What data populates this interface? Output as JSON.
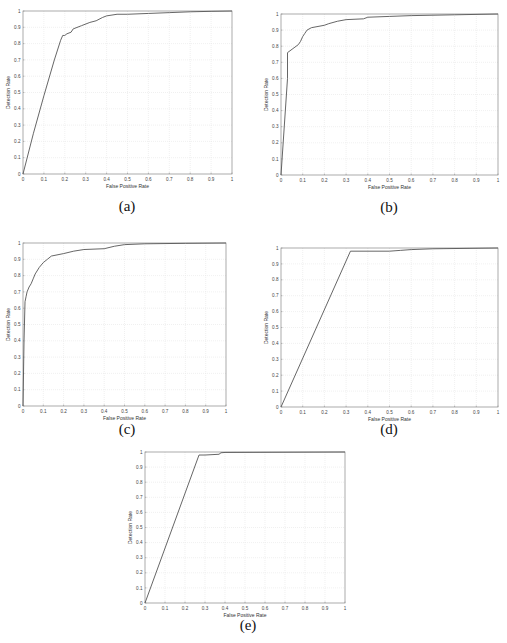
{
  "figure": {
    "captions": [
      "(a)",
      "(b)",
      "(c)",
      "(d)",
      "(e)"
    ]
  },
  "chart_data": [
    {
      "id": "a",
      "type": "line",
      "title": "",
      "caption": "(a)",
      "xlabel": "False Positive Rate",
      "ylabel": "Detection Rate",
      "xlim": [
        0,
        1
      ],
      "ylim": [
        0,
        1
      ],
      "xticks": [
        "0",
        "0.1",
        "0.2",
        "0.3",
        "0.4",
        "0.5",
        "0.6",
        "0.7",
        "0.8",
        "0.9",
        "1"
      ],
      "yticks": [
        "0",
        "0.1",
        "0.2",
        "0.3",
        "0.4",
        "0.5",
        "0.6",
        "0.7",
        "0.8",
        "0.9",
        "1"
      ],
      "grid": true,
      "legend": null,
      "values_note": "Approximate, traced from a low-resolution image. Axis ticks/labels and curve shape are reliable; intermediate point values are estimates.",
      "series": [
        {
          "name": "ROC",
          "x": [
            0,
            0.05,
            0.1,
            0.15,
            0.18,
            0.19,
            0.2,
            0.21,
            0.23,
            0.24,
            0.28,
            0.32,
            0.35,
            0.38,
            0.4,
            0.45,
            0.5,
            0.6,
            0.7,
            0.8,
            0.9,
            1.0
          ],
          "y": [
            0,
            0.25,
            0.48,
            0.7,
            0.82,
            0.85,
            0.85,
            0.86,
            0.87,
            0.89,
            0.91,
            0.93,
            0.94,
            0.96,
            0.97,
            0.98,
            0.98,
            0.985,
            0.99,
            0.995,
            0.998,
            1.0
          ]
        }
      ]
    },
    {
      "id": "b",
      "type": "line",
      "title": "",
      "caption": "(b)",
      "xlabel": "False Positive Rate",
      "ylabel": "Detection Rate",
      "xlim": [
        0,
        1
      ],
      "ylim": [
        0,
        1
      ],
      "xticks": [
        "0",
        "0.1",
        "0.2",
        "0.3",
        "0.4",
        "0.5",
        "0.6",
        "0.7",
        "0.8",
        "0.9",
        "1"
      ],
      "yticks": [
        "0",
        "0.1",
        "0.2",
        "0.3",
        "0.4",
        "0.5",
        "0.6",
        "0.7",
        "0.8",
        "0.9",
        "1"
      ],
      "grid": true,
      "legend": null,
      "values_note": "Approximate, traced from a low-resolution image. Axis ticks/labels and curve shape are reliable; intermediate point values are estimates.",
      "series": [
        {
          "name": "ROC",
          "x": [
            0,
            0.03,
            0.03,
            0.06,
            0.08,
            0.09,
            0.1,
            0.11,
            0.12,
            0.14,
            0.2,
            0.22,
            0.26,
            0.3,
            0.38,
            0.4,
            0.5,
            0.6,
            0.8,
            1.0
          ],
          "y": [
            0,
            0.6,
            0.76,
            0.79,
            0.81,
            0.83,
            0.86,
            0.88,
            0.9,
            0.915,
            0.93,
            0.94,
            0.955,
            0.965,
            0.97,
            0.98,
            0.985,
            0.99,
            0.995,
            1.0
          ]
        }
      ]
    },
    {
      "id": "c",
      "type": "line",
      "title": "",
      "caption": "(c)",
      "xlabel": "False Positive Rate",
      "ylabel": "Detection Rate",
      "xlim": [
        0,
        1
      ],
      "ylim": [
        0,
        1
      ],
      "xticks": [
        "0",
        "0.1",
        "0.2",
        "0.3",
        "0.4",
        "0.5",
        "0.6",
        "0.7",
        "0.8",
        "0.9",
        "1"
      ],
      "yticks": [
        "0",
        "0.1",
        "0.2",
        "0.3",
        "0.4",
        "0.5",
        "0.6",
        "0.7",
        "0.8",
        "0.9",
        "1"
      ],
      "grid": true,
      "legend": null,
      "values_note": "Approximate, traced from a low-resolution image. Axis ticks/labels and curve shape are reliable; intermediate point values are estimates.",
      "series": [
        {
          "name": "ROC",
          "x": [
            0,
            0.005,
            0.01,
            0.015,
            0.02,
            0.03,
            0.04,
            0.05,
            0.06,
            0.08,
            0.1,
            0.12,
            0.14,
            0.2,
            0.25,
            0.3,
            0.4,
            0.45,
            0.5,
            0.6,
            0.8,
            1.0
          ],
          "y": [
            0,
            0.4,
            0.64,
            0.67,
            0.7,
            0.73,
            0.75,
            0.78,
            0.81,
            0.85,
            0.88,
            0.9,
            0.92,
            0.935,
            0.95,
            0.96,
            0.965,
            0.98,
            0.99,
            0.995,
            0.998,
            1.0
          ]
        }
      ]
    },
    {
      "id": "d",
      "type": "line",
      "title": "",
      "caption": "(d)",
      "xlabel": "False Positive Rate",
      "ylabel": "Detection Rate",
      "xlim": [
        0,
        1
      ],
      "ylim": [
        0,
        1
      ],
      "xticks": [
        "0",
        "0.1",
        "0.2",
        "0.3",
        "0.4",
        "0.5",
        "0.6",
        "0.7",
        "0.8",
        "0.9",
        "1"
      ],
      "yticks": [
        "0",
        "0.1",
        "0.2",
        "0.3",
        "0.4",
        "0.5",
        "0.6",
        "0.7",
        "0.8",
        "0.9",
        "1"
      ],
      "grid": true,
      "legend": null,
      "values_note": "Approximate, traced from a low-resolution image. Axis ticks/labels and curve shape are reliable; intermediate point values are estimates.",
      "series": [
        {
          "name": "ROC",
          "x": [
            0,
            0.32,
            0.5,
            0.55,
            0.6,
            0.7,
            1.0
          ],
          "y": [
            0,
            0.98,
            0.98,
            0.985,
            0.99,
            0.995,
            1.0
          ]
        }
      ]
    },
    {
      "id": "e",
      "type": "line",
      "title": "",
      "caption": "(e)",
      "xlabel": "False Positive Rate",
      "ylabel": "Detection Rate",
      "xlim": [
        0,
        1
      ],
      "ylim": [
        0,
        1
      ],
      "xticks": [
        "0",
        "0.1",
        "0.2",
        "0.3",
        "0.4",
        "0.5",
        "0.6",
        "0.7",
        "0.8",
        "0.9",
        "1"
      ],
      "yticks": [
        "0",
        "0.1",
        "0.2",
        "0.3",
        "0.4",
        "0.5",
        "0.6",
        "0.7",
        "0.8",
        "0.9",
        "1"
      ],
      "grid": true,
      "legend": null,
      "values_note": "Approximate, traced from a low-resolution image. Axis ticks/labels and curve shape are reliable; intermediate point values are estimates.",
      "series": [
        {
          "name": "ROC",
          "x": [
            0,
            0.27,
            0.3,
            0.37,
            0.38,
            0.4,
            0.6,
            1.0
          ],
          "y": [
            0,
            0.98,
            0.98,
            0.985,
            0.995,
            0.997,
            0.998,
            1.0
          ]
        }
      ]
    }
  ],
  "layout_hints": {
    "panels": [
      {
        "id": "a",
        "left": 23,
        "top": 11,
        "width": 209,
        "height": 163,
        "caption_x": 127,
        "caption_y": 208
      },
      {
        "id": "b",
        "left": 281,
        "top": 14,
        "width": 217,
        "height": 161,
        "caption_x": 389,
        "caption_y": 209
      },
      {
        "id": "c",
        "left": 23,
        "top": 243,
        "width": 203,
        "height": 163,
        "caption_x": 127,
        "caption_y": 431
      },
      {
        "id": "d",
        "left": 281,
        "top": 248,
        "width": 217,
        "height": 159,
        "caption_x": 389,
        "caption_y": 431
      },
      {
        "id": "e",
        "left": 145,
        "top": 452,
        "width": 200,
        "height": 151,
        "caption_x": 248,
        "caption_y": 627
      }
    ],
    "colors": {
      "curve": "#555555",
      "axis": "#888888",
      "grid": "#e6e6e6",
      "background": "#ffffff"
    }
  }
}
